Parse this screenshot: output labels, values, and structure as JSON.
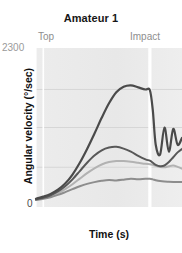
{
  "chart_data": {
    "type": "line",
    "title": "Amateur 1",
    "xlabel": "Time (s)",
    "ylabel": "Angular velocity  (°/sec)",
    "ylim": [
      0,
      2300
    ],
    "ytick_labels": [
      "2300",
      "0"
    ],
    "ytick_values": [
      2300,
      0
    ],
    "grid": true,
    "gridlines_y": [
      1700,
      1150,
      575
    ],
    "legend": "none",
    "annotations": [
      {
        "label": "Top",
        "x": 0.05,
        "type": "vertical-marker"
      },
      {
        "label": "Impact",
        "x": 0.78,
        "type": "vertical-marker"
      }
    ],
    "x": [
      0.0,
      0.05,
      0.1,
      0.15,
      0.2,
      0.25,
      0.3,
      0.35,
      0.4,
      0.45,
      0.5,
      0.55,
      0.6,
      0.65,
      0.7,
      0.75,
      0.78,
      0.8,
      0.82,
      0.85,
      0.88,
      0.91,
      0.94,
      0.97,
      1.0
    ],
    "series": [
      {
        "name": "Club head",
        "color": "#4a4a4a",
        "width": 2.2,
        "values": [
          120,
          150,
          190,
          250,
          340,
          470,
          640,
          840,
          1060,
          1290,
          1500,
          1660,
          1740,
          1760,
          1730,
          1700,
          1690,
          1400,
          900,
          760,
          1150,
          800,
          1130,
          900,
          1000
        ]
      },
      {
        "name": "Arm",
        "color": "#585858",
        "width": 2.0,
        "values": [
          110,
          135,
          170,
          225,
          300,
          400,
          520,
          640,
          745,
          820,
          860,
          870,
          845,
          800,
          740,
          690,
          670,
          640,
          610,
          590,
          600,
          650,
          720,
          790,
          840
        ]
      },
      {
        "name": "Trunk",
        "color": "#b2b2b2",
        "width": 2.0,
        "values": [
          105,
          125,
          155,
          200,
          260,
          330,
          410,
          490,
          560,
          615,
          650,
          665,
          665,
          655,
          640,
          625,
          620,
          610,
          595,
          580,
          575,
          590,
          600,
          580,
          555
        ]
      },
      {
        "name": "Pelvis",
        "color": "#8d8d8d",
        "width": 2.0,
        "values": [
          100,
          118,
          142,
          175,
          215,
          258,
          300,
          335,
          360,
          380,
          392,
          385,
          395,
          410,
          400,
          410,
          408,
          400,
          388,
          375,
          368,
          365,
          363,
          362,
          362
        ]
      }
    ]
  }
}
